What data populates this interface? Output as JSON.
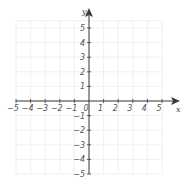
{
  "chart_data": {
    "type": "scatter",
    "title": "",
    "xlabel": "x",
    "ylabel": "y",
    "xlim": [
      -5,
      5
    ],
    "ylim": [
      -5,
      5
    ],
    "grid": true,
    "x_ticks": [
      -5,
      -4,
      -3,
      -2,
      -1,
      0,
      1,
      2,
      3,
      4,
      5
    ],
    "y_ticks": [
      -5,
      -4,
      -3,
      -2,
      -1,
      1,
      2,
      3,
      4,
      5
    ],
    "x_tick_labels": [
      "−5",
      "−4",
      "−3",
      "−2",
      "−1",
      "0",
      "1",
      "2",
      "3",
      "4",
      "5"
    ],
    "y_tick_labels": [
      "−5",
      "−4",
      "−3",
      "−2",
      "−1",
      "1",
      "2",
      "3",
      "4",
      "5"
    ],
    "series": [],
    "legend": null
  },
  "style": {
    "axis_color": "#3a3a3a",
    "grid_color": "#ececec",
    "background": "#ffffff"
  }
}
